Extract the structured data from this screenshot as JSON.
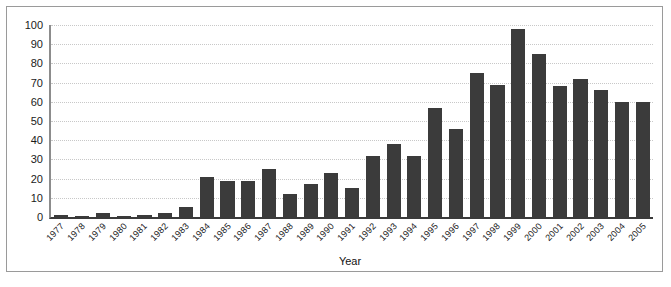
{
  "chart_data": {
    "type": "bar",
    "title": "",
    "subtitle": "",
    "xlabel": "Year",
    "ylabel": "",
    "categories": [
      "1977",
      "1978",
      "1979",
      "1980",
      "1981",
      "1982",
      "1983",
      "1984",
      "1985",
      "1986",
      "1987",
      "1988",
      "1989",
      "1990",
      "1991",
      "1992",
      "1993",
      "1994",
      "1995",
      "1996",
      "1997",
      "1998",
      "1999",
      "2000",
      "2001",
      "2002",
      "2003",
      "2004",
      "2005"
    ],
    "values": [
      1,
      0,
      2,
      0,
      1,
      2,
      5,
      21,
      19,
      19,
      25,
      12,
      17,
      23,
      15,
      32,
      38,
      32,
      57,
      46,
      75,
      69,
      98,
      85,
      68,
      72,
      66,
      60,
      60
    ],
    "series": [
      {
        "name": "Count",
        "values": [
          1,
          0,
          2,
          0,
          1,
          2,
          5,
          21,
          19,
          19,
          25,
          12,
          17,
          23,
          15,
          32,
          38,
          32,
          57,
          46,
          75,
          69,
          98,
          85,
          68,
          72,
          66,
          60,
          60
        ]
      }
    ],
    "ylim": [
      0,
      100
    ],
    "ytick_labels": [
      "0",
      "10",
      "20",
      "30",
      "40",
      "50",
      "60",
      "70",
      "80",
      "90",
      "100"
    ],
    "ytick_values": [
      0,
      10,
      20,
      30,
      40,
      50,
      60,
      70,
      80,
      90,
      100
    ],
    "grid": true,
    "grid_axis": "y",
    "legend": false,
    "legend_position": "none",
    "bar_color": "#3b3b3b",
    "grid_color": "#c8c8c8",
    "axis_color": "#3a3a3a",
    "background_color": "#ffffff",
    "frame_color": "#9a9a9a"
  }
}
